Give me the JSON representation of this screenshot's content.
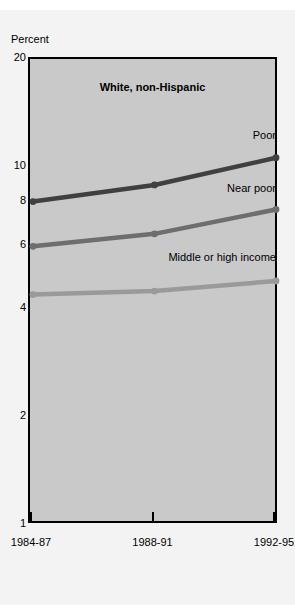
{
  "figure": {
    "top_clipped_text": "",
    "panel_title": "White, non-Hispanic",
    "y_axis_title": "Percent"
  },
  "chart_data": {
    "type": "line",
    "title": "White, non-Hispanic",
    "xlabel": "",
    "ylabel": "Percent",
    "yscale": "log",
    "ylim": [
      1,
      20
    ],
    "grid": false,
    "legend_position": "inline-right-of-each-line",
    "categories": [
      "1984-87",
      "1988-91",
      "1992-95"
    ],
    "yticks": [
      {
        "value": 20,
        "label": "20"
      },
      {
        "value": 10,
        "label": "10"
      },
      {
        "value": 8,
        "label": "8"
      },
      {
        "value": 6,
        "label": "6"
      },
      {
        "value": 4,
        "label": "4"
      },
      {
        "value": 2,
        "label": "2"
      },
      {
        "value": 1,
        "label": "1"
      }
    ],
    "series": [
      {
        "name": "Poor",
        "label": "Poor",
        "color": "#404040",
        "values": [
          8.0,
          8.9,
          10.6
        ]
      },
      {
        "name": "Near poor",
        "label": "Near poor",
        "color": "#6e6e6e",
        "values": [
          6.0,
          6.5,
          7.6
        ]
      },
      {
        "name": "Middle or high income",
        "label": "Middle or high income",
        "color": "#9a9a9a",
        "values": [
          4.4,
          4.5,
          4.8
        ]
      }
    ]
  },
  "colors": {
    "panel_background": "#c9c9c9",
    "figure_background": "#f3f3f3",
    "axis": "#000000",
    "poor": "#404040",
    "near_poor": "#6e6e6e",
    "middle_high": "#9a9a9a"
  }
}
